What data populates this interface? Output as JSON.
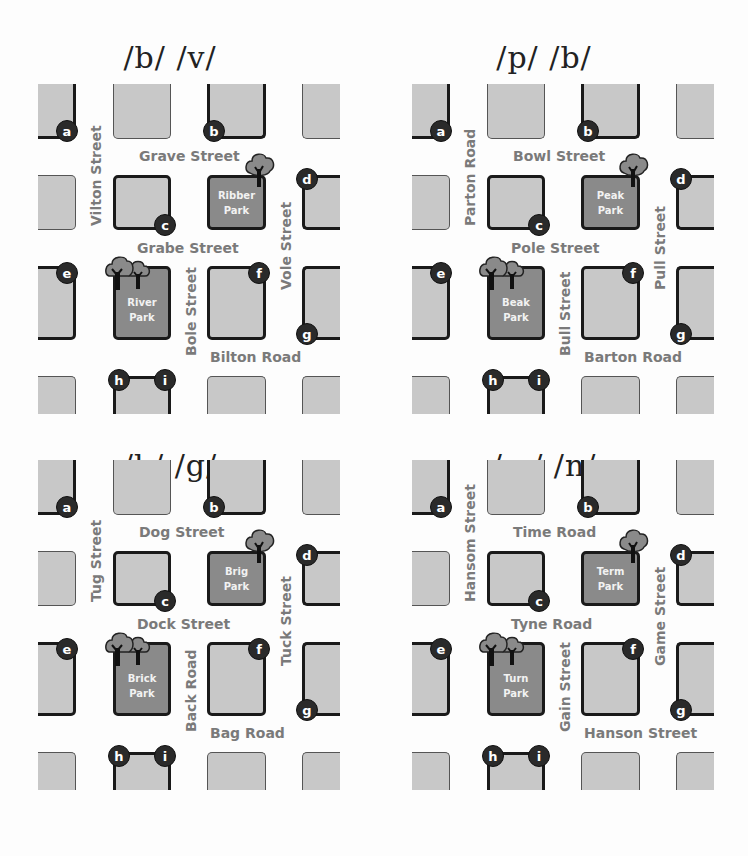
{
  "panels": [
    {
      "title": "/b/ /v/",
      "streets": {
        "top_horizontal": "Grave Street",
        "middle_horizontal": "Grabe Street",
        "bottom_horizontal": "Bilton Road",
        "left_vertical": "Vilton Street",
        "center_vertical": "Bole Street",
        "right_vertical": "Vole Street"
      },
      "parks": {
        "upper": [
          "Ribber",
          "Park"
        ],
        "lower": [
          "River",
          "Park"
        ]
      }
    },
    {
      "title": "/p/ /b/",
      "streets": {
        "top_horizontal": "Bowl Street",
        "middle_horizontal": "Pole Street",
        "bottom_horizontal": "Barton Road",
        "left_vertical": "Parton Road",
        "center_vertical": "Bull Street",
        "right_vertical": "Pull Street"
      },
      "parks": {
        "upper": [
          "Peak",
          "Park"
        ],
        "lower": [
          "Beak",
          "Park"
        ]
      }
    },
    {
      "title": "/k/ /g/",
      "streets": {
        "top_horizontal": "Dog Street",
        "middle_horizontal": "Dock Street",
        "bottom_horizontal": "Bag Road",
        "left_vertical": "Tug Street",
        "center_vertical": "Back Road",
        "right_vertical": "Tuck Street"
      },
      "parks": {
        "upper": [
          "Brig",
          "Park"
        ],
        "lower": [
          "Brick",
          "Park"
        ]
      }
    },
    {
      "title": "/m/ /n/",
      "streets": {
        "top_horizontal": "Time Road",
        "middle_horizontal": "Tyne Road",
        "bottom_horizontal": "Hanson Street",
        "left_vertical": "Hansom Street",
        "center_vertical": "Gain Street",
        "right_vertical": "Game Street"
      },
      "parks": {
        "upper": [
          "Term",
          "Park"
        ],
        "lower": [
          "Turn",
          "Park"
        ]
      }
    }
  ],
  "markers": [
    "a",
    "b",
    "c",
    "d",
    "e",
    "f",
    "g",
    "h",
    "i"
  ],
  "colors": {
    "block": "#c8c8c8",
    "park": "#8a8a8a",
    "marker": "#2a2a2a",
    "street_text": "#7a7a7a",
    "route_line": "#1a1a1a"
  }
}
